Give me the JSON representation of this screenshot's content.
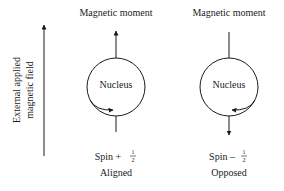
{
  "field_axis": {
    "label_line1": "External applied",
    "label_line2": "magnetic field"
  },
  "states": [
    {
      "moment_label": "Magnetic moment",
      "nucleus_label": "Nucleus",
      "spin_text": "Spin + ",
      "spin_num": "1",
      "spin_den": "2",
      "orientation": "Aligned"
    },
    {
      "moment_label": "Magnetic moment",
      "nucleus_label": "Nucleus",
      "spin_text": "Spin – ",
      "spin_num": "1",
      "spin_den": "2",
      "orientation": "Opposed"
    }
  ],
  "colors": {
    "ink": "#1a1a1a",
    "background": "#ffffff"
  }
}
